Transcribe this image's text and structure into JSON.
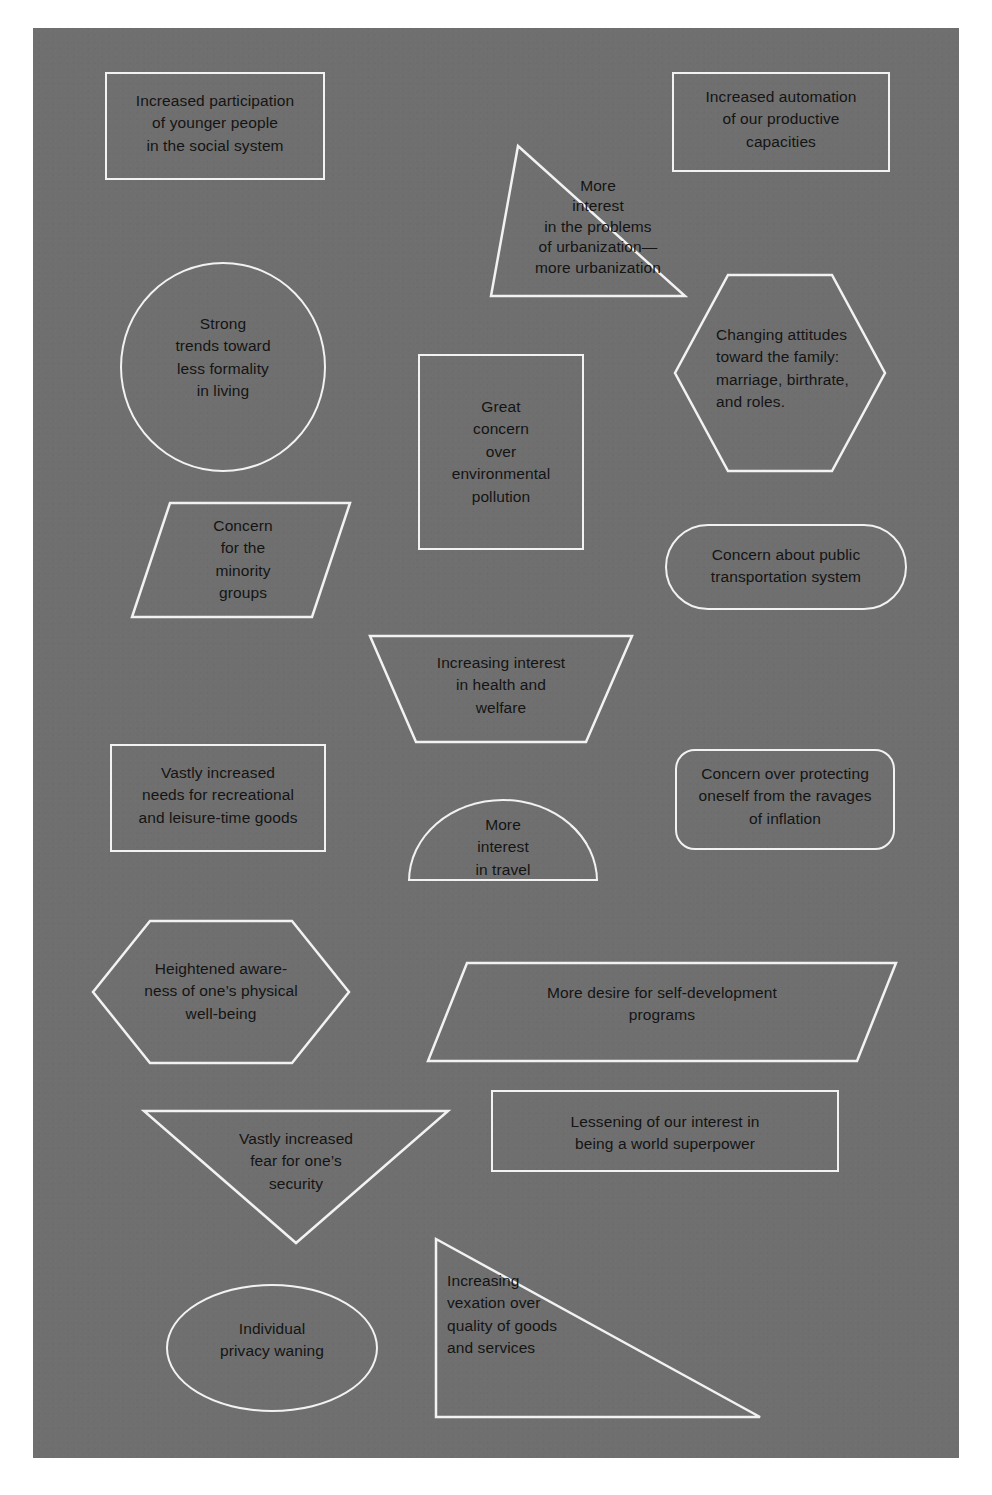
{
  "page": {
    "background_color": "#6f6f6f",
    "border_color": "#ffffff",
    "shape_outline_color": "#f2f2f2",
    "text_color": "#141414"
  },
  "shapes": [
    {
      "id": "increased-participation",
      "shape": "rectangle",
      "text": "Increased participation\nof younger people\nin the social system"
    },
    {
      "id": "increased-automation",
      "shape": "rectangle",
      "text": "Increased automation\nof our productive\ncapacities"
    },
    {
      "id": "urbanization-interest",
      "shape": "triangle",
      "text": "More\ninterest\nin the problems\nof urbanization—\nmore urbanization"
    },
    {
      "id": "less-formality",
      "shape": "circle",
      "text": "Strong\ntrends toward\nless formality\nin living"
    },
    {
      "id": "changing-attitudes-family",
      "shape": "hexagon",
      "text": "Changing attitudes\ntoward the family:\nmarriage, birthrate,\nand roles."
    },
    {
      "id": "environmental-pollution",
      "shape": "square",
      "text": "Great\nconcern\nover\nenvironmental\npollution"
    },
    {
      "id": "minority-groups",
      "shape": "parallelogram",
      "text": "Concern\nfor the\nminority\ngroups"
    },
    {
      "id": "public-transportation",
      "shape": "pill",
      "text": "Concern about public\ntransportation system"
    },
    {
      "id": "health-and-welfare",
      "shape": "trapezoid",
      "text": "Increasing interest\nin health and\nwelfare"
    },
    {
      "id": "recreational-goods",
      "shape": "rectangle",
      "text": "Vastly increased\nneeds for recreational\nand leisure-time goods"
    },
    {
      "id": "interest-in-travel",
      "shape": "semicircle",
      "text": "More\ninterest\nin travel"
    },
    {
      "id": "ravages-of-inflation",
      "shape": "rounded-rectangle",
      "text": "Concern over protecting\noneself from the ravages\nof inflation"
    },
    {
      "id": "physical-well-being",
      "shape": "hexagon",
      "text": "Heightened aware-\nness of one’s physical\nwell-being"
    },
    {
      "id": "self-development-programs",
      "shape": "parallelogram",
      "text": "More desire for self-development\nprograms"
    },
    {
      "id": "fear-for-security",
      "shape": "inverted-triangle",
      "text": "Vastly increased\nfear for one’s\nsecurity"
    },
    {
      "id": "world-superpower",
      "shape": "rectangle",
      "text": "Lessening of our interest in\nbeing a world superpower"
    },
    {
      "id": "individual-privacy",
      "shape": "ellipse",
      "text": "Individual\nprivacy waning"
    },
    {
      "id": "quality-of-goods",
      "shape": "right-triangle",
      "text": "Increasing\nvexation over\nquality of goods\nand services"
    }
  ]
}
